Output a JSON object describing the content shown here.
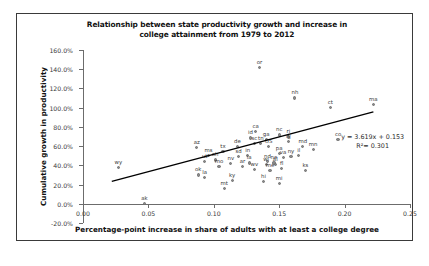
{
  "chart_data": {
    "type": "scatter",
    "title": "Relationship between state productivity growth and increase in college attainment from 1979 to 2012",
    "title_line1": "Relationship between state productivity growth and increase in",
    "title_line2": "college attainment from 1979 to 2012",
    "xlabel": "Percentage-point increase in share of adults with at least a college degree",
    "ylabel": "Cumulative growth in productivity",
    "xlim": [
      0.0,
      0.25
    ],
    "ylim": [
      -0.2,
      1.6
    ],
    "xticks": [
      "0.00",
      "0.05",
      "0.10",
      "0.15",
      "0.20",
      "0.25"
    ],
    "xtick_values": [
      0.0,
      0.05,
      0.1,
      0.15,
      0.2,
      0.25
    ],
    "yticks": [
      "-20.0%",
      "0.0%",
      "20.0%",
      "40.0%",
      "60.0%",
      "80.0%",
      "100.0%",
      "120.0%",
      "140.0%",
      "160.0%"
    ],
    "ytick_values": [
      -0.2,
      0.0,
      0.2,
      0.4,
      0.6,
      0.8,
      1.0,
      1.2,
      1.4,
      1.6
    ],
    "grid": false,
    "legend": "none",
    "marker_color": "#8a8a8a",
    "trendline_color": "#000000",
    "trendline": {
      "equation": "y = 3.619x + 0.153",
      "r2_label": "R²= 0.301",
      "slope": 3.619,
      "intercept": 0.153,
      "r2": 0.301,
      "x_start": 0.022,
      "x_end": 0.222
    },
    "points": [
      {
        "label": "wy",
        "x": 0.027,
        "y": 0.38
      },
      {
        "label": "ak",
        "x": 0.047,
        "y": 0.0
      },
      {
        "label": "ok",
        "x": 0.088,
        "y": 0.3
      },
      {
        "label": "la",
        "x": 0.093,
        "y": 0.275
      },
      {
        "label": "ut",
        "x": 0.093,
        "y": 0.44
      },
      {
        "label": "ms",
        "x": 0.096,
        "y": 0.5
      },
      {
        "label": "az",
        "x": 0.087,
        "y": 0.585
      },
      {
        "label": "oh",
        "x": 0.101,
        "y": 0.455
      },
      {
        "label": "mo",
        "x": 0.104,
        "y": 0.385
      },
      {
        "label": "tx",
        "x": 0.107,
        "y": 0.545
      },
      {
        "label": "mt",
        "x": 0.108,
        "y": 0.16
      },
      {
        "label": "ky",
        "x": 0.114,
        "y": 0.245
      },
      {
        "label": "nv",
        "x": 0.113,
        "y": 0.415
      },
      {
        "label": "de",
        "x": 0.118,
        "y": 0.595
      },
      {
        "label": "sd",
        "x": 0.119,
        "y": 0.495
      },
      {
        "label": "ar",
        "x": 0.122,
        "y": 0.39
      },
      {
        "label": "in",
        "x": 0.126,
        "y": 0.5
      },
      {
        "label": "ia",
        "x": 0.127,
        "y": 0.425
      },
      {
        "label": "id",
        "x": 0.128,
        "y": 0.685
      },
      {
        "label": "sc",
        "x": 0.131,
        "y": 0.63
      },
      {
        "label": "ca",
        "x": 0.132,
        "y": 0.755
      },
      {
        "label": "wv",
        "x": 0.131,
        "y": 0.36
      },
      {
        "label": "tn",
        "x": 0.136,
        "y": 0.625
      },
      {
        "label": "or",
        "x": 0.135,
        "y": 1.42
      },
      {
        "label": "ga",
        "x": 0.14,
        "y": 0.67
      },
      {
        "label": "hi",
        "x": 0.138,
        "y": 0.23
      },
      {
        "label": "US",
        "x": 0.142,
        "y": 0.6
      },
      {
        "label": "nd",
        "x": 0.141,
        "y": 0.44
      },
      {
        "label": "wi",
        "x": 0.14,
        "y": 0.405
      },
      {
        "label": "me",
        "x": 0.143,
        "y": 0.345
      },
      {
        "label": "ne",
        "x": 0.146,
        "y": 0.425
      },
      {
        "label": "al",
        "x": 0.147,
        "y": 0.405
      },
      {
        "label": "pa",
        "x": 0.15,
        "y": 0.525
      },
      {
        "label": "nc",
        "x": 0.15,
        "y": 0.715
      },
      {
        "label": "fl",
        "x": 0.152,
        "y": 0.365
      },
      {
        "label": "mi",
        "x": 0.15,
        "y": 0.215
      },
      {
        "label": "va",
        "x": 0.153,
        "y": 0.485
      },
      {
        "label": "ri",
        "x": 0.157,
        "y": 0.695
      },
      {
        "label": "nj",
        "x": 0.157,
        "y": 0.645
      },
      {
        "label": "ny",
        "x": 0.159,
        "y": 0.49
      },
      {
        "label": "nh",
        "x": 0.162,
        "y": 1.1
      },
      {
        "label": "il",
        "x": 0.165,
        "y": 0.505
      },
      {
        "label": "md",
        "x": 0.168,
        "y": 0.595
      },
      {
        "label": "ks",
        "x": 0.17,
        "y": 0.345
      },
      {
        "label": "mn",
        "x": 0.176,
        "y": 0.565
      },
      {
        "label": "ct",
        "x": 0.189,
        "y": 1.0
      },
      {
        "label": "co",
        "x": 0.195,
        "y": 0.665
      },
      {
        "label": "ma",
        "x": 0.222,
        "y": 1.03
      }
    ]
  }
}
